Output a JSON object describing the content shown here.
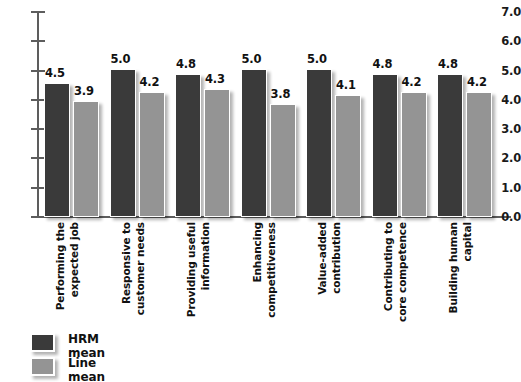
{
  "chart_data": {
    "type": "bar",
    "title": "",
    "subtitle": "",
    "xlabel": "",
    "ylabel": "",
    "ylim": [
      0.0,
      7.0
    ],
    "ytick_step": 1.0,
    "yticks": [
      "7.0",
      "6.0",
      "5.0",
      "4.0",
      "3.0",
      "2.0",
      "1.0",
      "0.0"
    ],
    "grid": false,
    "legend_position": "bottom-left",
    "categories": [
      "Performing the expected job",
      "Responsive to customer needs",
      "Providing useful information",
      "Enhancing competitiveness",
      "Value-added contribution",
      "Contributing to core competence",
      "Building human capital"
    ],
    "category_lines": [
      [
        "Performing the",
        "expected job"
      ],
      [
        "Responsive to",
        "customer needs"
      ],
      [
        "Providing useful",
        "information"
      ],
      [
        "Enhancing",
        "competitiveness"
      ],
      [
        "Value-added",
        "contribution"
      ],
      [
        "Contributing to",
        "core competence"
      ],
      [
        "Building human",
        "capital"
      ]
    ],
    "series": [
      {
        "name": "HRM mean",
        "color": "#3a3a3a",
        "values": [
          4.5,
          5.0,
          4.8,
          5.0,
          5.0,
          4.8,
          4.8
        ],
        "labels": [
          "4.5",
          "5.0",
          "4.8",
          "5.0",
          "5.0",
          "4.8",
          "4.8"
        ]
      },
      {
        "name": "Line mean",
        "color": "#949494",
        "values": [
          3.9,
          4.2,
          4.3,
          3.8,
          4.1,
          4.2,
          4.2
        ],
        "labels": [
          "3.9",
          "4.2",
          "4.3",
          "3.8",
          "4.1",
          "4.2",
          "4.2"
        ]
      }
    ]
  },
  "legend": {
    "items": [
      {
        "label": "HRM mean",
        "color": "#3a3a3a"
      },
      {
        "label": "Line mean",
        "color": "#949494"
      }
    ]
  },
  "colors": {
    "hrm": "#3a3a3a",
    "line": "#949494",
    "axis": "#5d5d5d",
    "text": "#111111",
    "background": "#ffffff"
  }
}
